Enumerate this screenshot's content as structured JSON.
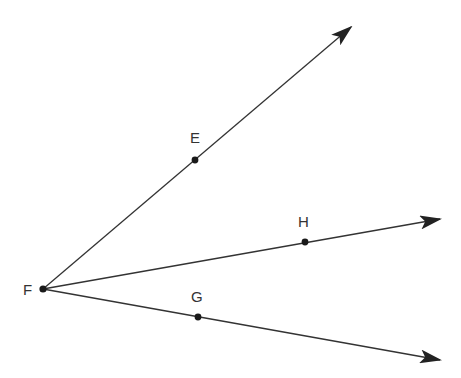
{
  "diagram": {
    "type": "geometry-rays",
    "colors": {
      "stroke": "#333333",
      "point": "#1a1a1a",
      "background": "#ffffff"
    },
    "vertex": {
      "name": "F",
      "label": "F",
      "x": 43,
      "y": 289
    },
    "points": [
      {
        "name": "E",
        "label": "E",
        "x": 195,
        "y": 160
      },
      {
        "name": "H",
        "label": "H",
        "x": 305,
        "y": 242
      },
      {
        "name": "G",
        "label": "G",
        "x": 198,
        "y": 317
      }
    ],
    "rays": [
      {
        "name": "FE",
        "from": "F",
        "through": "E",
        "tip": [
          351,
          27
        ]
      },
      {
        "name": "FH",
        "from": "F",
        "through": "H",
        "tip": [
          440,
          219
        ]
      },
      {
        "name": "FG",
        "from": "F",
        "through": "G",
        "tip": [
          440,
          360
        ]
      }
    ],
    "labels": {
      "F": "F",
      "E": "E",
      "H": "H",
      "G": "G"
    }
  }
}
